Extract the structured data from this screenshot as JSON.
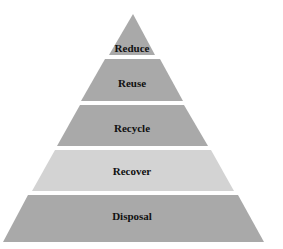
{
  "diagram": {
    "type": "pyramid",
    "colors": {
      "dark_tier": "#a9a9a9",
      "light_tier": "#d3d3d3",
      "label": "#111111",
      "background": "#ffffff"
    },
    "tiers": [
      {
        "label": "Reduce",
        "shade": "dark"
      },
      {
        "label": "Reuse",
        "shade": "dark"
      },
      {
        "label": "Recycle",
        "shade": "dark"
      },
      {
        "label": "Recover",
        "shade": "light"
      },
      {
        "label": "Disposal",
        "shade": "dark"
      }
    ]
  }
}
